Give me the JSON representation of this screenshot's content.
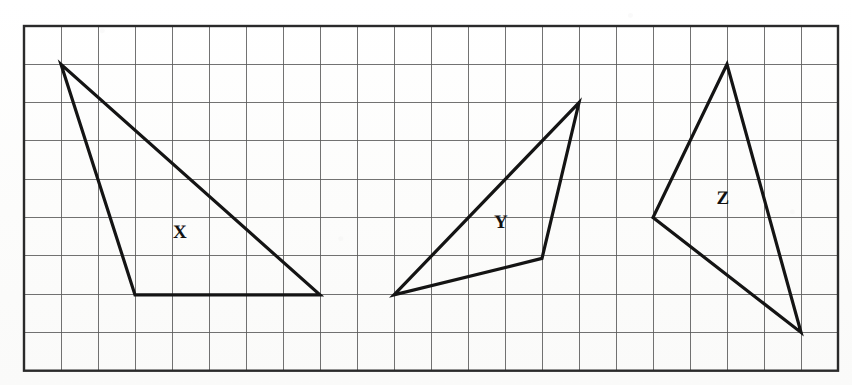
{
  "figure": {
    "background_color": "#fdfdfc",
    "ink_color": "#141414",
    "grid_line_color": "#5a5a5a",
    "border_color": "#2a2a2a"
  },
  "grid": {
    "origin_x": 24,
    "origin_y": 26,
    "cell_width": 37.0,
    "cell_height": 38.3,
    "columns": 22,
    "rows": 9,
    "line_width": 1,
    "border_width": 2.4
  },
  "shapes": [
    {
      "label": "X",
      "name": "triangle-x",
      "label_x": 180,
      "label_y": 232,
      "stroke_width": 3.2,
      "vertices_grid": [
        [
          1,
          1
        ],
        [
          3,
          7
        ],
        [
          8,
          7
        ]
      ],
      "vertices_px": [
        [
          61,
          64.3
        ],
        [
          135,
          294.9
        ],
        [
          320,
          294.9
        ]
      ],
      "points": "61,64.3 135,294.9 320,294.9"
    },
    {
      "label": "Y",
      "name": "triangle-y",
      "label_x": 501,
      "label_y": 222,
      "stroke_width": 3.2,
      "vertices_grid": [
        [
          15,
          2
        ],
        [
          10,
          7
        ],
        [
          14,
          6
        ]
      ],
      "vertices_px": [
        [
          579,
          102.6
        ],
        [
          394,
          294.9
        ],
        [
          542,
          258.4
        ]
      ],
      "points": "579,102.6 394,294.9 542,258.4"
    },
    {
      "label": "Z",
      "name": "triangle-z",
      "label_x": 723,
      "label_y": 198,
      "stroke_width": 3.2,
      "vertices_grid": [
        [
          19,
          1
        ],
        [
          17,
          5
        ],
        [
          21,
          8
        ]
      ],
      "vertices_px": [
        [
          727,
          64.3
        ],
        [
          653,
          217.5
        ],
        [
          801,
          332.4
        ]
      ],
      "points": "727,64.3 653,217.5 801,332.4"
    }
  ]
}
